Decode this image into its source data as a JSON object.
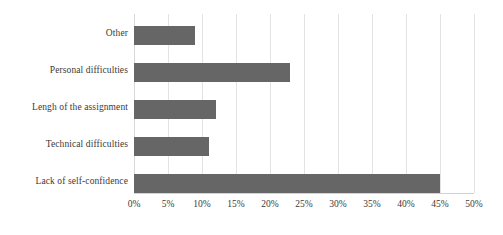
{
  "chart_data": {
    "type": "bar",
    "orientation": "horizontal",
    "title": "",
    "subtitle": "",
    "xlabel": "",
    "ylabel": "",
    "categories": [
      "Other",
      "Personal difficulties",
      "Lengh of the assignment",
      "Technical difficulties",
      "Lack of self-confidence"
    ],
    "values": [
      9,
      23,
      12,
      11,
      45
    ],
    "value_labels": [
      "9%",
      "23%",
      "12%",
      "11%",
      "45%"
    ],
    "xlim": [
      0,
      50
    ],
    "xtick_values": [
      0,
      5,
      10,
      15,
      20,
      25,
      30,
      35,
      40,
      45,
      50
    ],
    "xtick_labels": [
      "0%",
      "5%",
      "10%",
      "15%",
      "20%",
      "25%",
      "30%",
      "35%",
      "40%",
      "45%",
      "50%"
    ],
    "grid": true,
    "grid_axis": "x",
    "legend": false,
    "legend_position": "none",
    "data_labels_shown": false,
    "series": [
      {
        "name": "",
        "values": [
          9,
          23,
          12,
          11,
          45
        ]
      }
    ]
  },
  "style": {
    "bar_color": "#666666",
    "grid_color": "#e3e3e3",
    "axis_color": "#d2d2d2",
    "text_color": "#3a3a3a",
    "background": "#ffffff"
  }
}
